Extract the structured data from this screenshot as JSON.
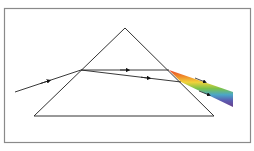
{
  "diagram": {
    "frame": {
      "x": 4,
      "y": 8,
      "w": 247,
      "h": 135,
      "stroke": "#8a8a8a"
    },
    "prism": {
      "apex": [
        125,
        28
      ],
      "base_left": [
        34,
        116
      ],
      "base_right": [
        214,
        116
      ],
      "stroke": "#333333"
    },
    "incident_ray": {
      "from": [
        15,
        92
      ],
      "to": [
        81,
        70
      ]
    },
    "refracted_rays": [
      {
        "from": [
          81,
          70
        ],
        "to": [
          169,
          70
        ]
      },
      {
        "from": [
          81,
          70
        ],
        "to": [
          181,
          82
        ]
      }
    ],
    "spectrum_colors": [
      "#e8452c",
      "#f08a2a",
      "#f2d23a",
      "#7cc24a",
      "#4aa6c8",
      "#5b5bb0",
      "#6a3f8c"
    ],
    "spectrum_band": {
      "top_start": [
        169,
        70
      ],
      "bottom_start": [
        181,
        82
      ],
      "top_end": [
        233,
        92
      ],
      "bottom_end": [
        233,
        107
      ]
    }
  }
}
